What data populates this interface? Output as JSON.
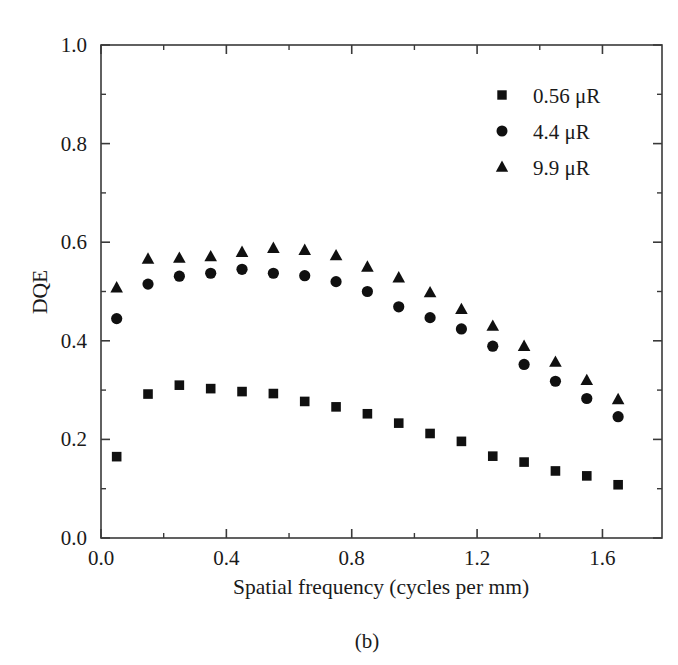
{
  "figure": {
    "caption": "(b)",
    "background_color": "#ffffff",
    "marker_color": "#101010",
    "axis_color": "#3a3a3a"
  },
  "chart_data": {
    "type": "scatter",
    "title": "",
    "subtitle": "",
    "xlabel": "Spatial frequency (cycles per mm)",
    "ylabel": "DQE",
    "xlim": [
      0.0,
      1.79
    ],
    "ylim": [
      0.0,
      1.0
    ],
    "grid": false,
    "legend_position": "top-right",
    "x_ticks": [
      "0.0",
      "0.4",
      "0.8",
      "1.2",
      "1.6"
    ],
    "x_tick_values": [
      0.0,
      0.4,
      0.8,
      1.2,
      1.6
    ],
    "x_minor_tick_values": [
      0.2,
      0.6,
      1.0,
      1.4
    ],
    "y_ticks": [
      "0.0",
      "0.2",
      "0.4",
      "0.6",
      "0.8",
      "1.0"
    ],
    "y_tick_values": [
      0.0,
      0.2,
      0.4,
      0.6,
      0.8,
      1.0
    ],
    "y_minor_tick_values": [
      0.1,
      0.3,
      0.5,
      0.7,
      0.9
    ],
    "x": [
      0.05,
      0.15,
      0.25,
      0.35,
      0.45,
      0.55,
      0.65,
      0.75,
      0.85,
      0.95,
      1.05,
      1.15,
      1.25,
      1.35,
      1.45,
      1.55,
      1.65
    ],
    "series": [
      {
        "name": "0.56 μR",
        "marker": "square",
        "values": [
          0.165,
          0.292,
          0.31,
          0.303,
          0.297,
          0.293,
          0.277,
          0.266,
          0.252,
          0.233,
          0.212,
          0.196,
          0.166,
          0.154,
          0.136,
          0.126,
          0.108
        ]
      },
      {
        "name": "4.4 μR",
        "marker": "circle",
        "values": [
          0.445,
          0.515,
          0.531,
          0.537,
          0.545,
          0.537,
          0.532,
          0.52,
          0.5,
          0.469,
          0.447,
          0.424,
          0.389,
          0.352,
          0.318,
          0.283,
          0.246
        ]
      },
      {
        "name": "9.9 μR",
        "marker": "triangle",
        "values": [
          0.508,
          0.566,
          0.568,
          0.571,
          0.58,
          0.588,
          0.584,
          0.573,
          0.55,
          0.528,
          0.498,
          0.464,
          0.43,
          0.389,
          0.357,
          0.32,
          0.281
        ]
      }
    ]
  },
  "legend": {
    "entries": [
      {
        "label": "0.56 μR",
        "marker": "square"
      },
      {
        "label": "4.4 μR",
        "marker": "circle"
      },
      {
        "label": "9.9 μR",
        "marker": "triangle"
      }
    ]
  }
}
